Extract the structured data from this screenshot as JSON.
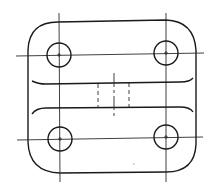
{
  "drawing": {
    "type": "mechanical part plan view",
    "stroke_color": "#1a1a1a",
    "background": "#ffffff",
    "outline": {
      "x": 27,
      "y": 20,
      "width": 170,
      "height": 153,
      "corner_radius": 25
    },
    "holes": [
      {
        "id": "top-left",
        "cx": 59,
        "cy": 55,
        "r": 12
      },
      {
        "id": "top-right",
        "cx": 166,
        "cy": 53,
        "r": 12
      },
      {
        "id": "bottom-left",
        "cx": 60,
        "cy": 139,
        "r": 12
      },
      {
        "id": "bottom-right",
        "cx": 166,
        "cy": 137,
        "r": 12
      }
    ],
    "centerlines": {
      "vertical": [
        59,
        166
      ],
      "horizontal": [
        55,
        139
      ]
    },
    "slot": {
      "top_y": 82,
      "bottom_y": 108,
      "x_start": 32,
      "x_end": 193
    },
    "hidden_lines_x": [
      98,
      129
    ],
    "center_mark_x": 114
  }
}
